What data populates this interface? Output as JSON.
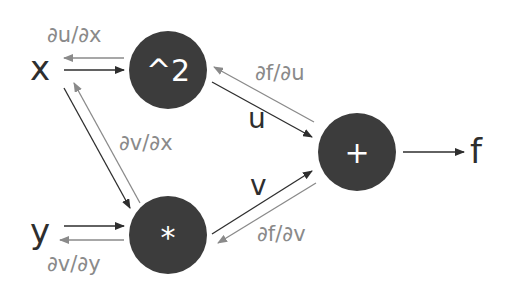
{
  "diagram": {
    "type": "computational-graph",
    "colors": {
      "node_fill": "#3c3c3c",
      "node_text": "#ffffff",
      "forward_edge": "#2e2e2e",
      "backward_edge": "#8a8a8a",
      "background": "#ffffff"
    },
    "inputs": {
      "x": "x",
      "y": "y"
    },
    "nodes": {
      "square": {
        "label": "^2"
      },
      "multiply": {
        "label": "*"
      },
      "add": {
        "label": "+"
      }
    },
    "intermediates": {
      "u": "u",
      "v": "v"
    },
    "output": {
      "f": "f"
    },
    "gradients": {
      "du_dx": "∂u/∂x",
      "dv_dx": "∂v/∂x",
      "dv_dy": "∂v/∂y",
      "df_du": "∂f/∂u",
      "df_dv": "∂f/∂v"
    }
  }
}
